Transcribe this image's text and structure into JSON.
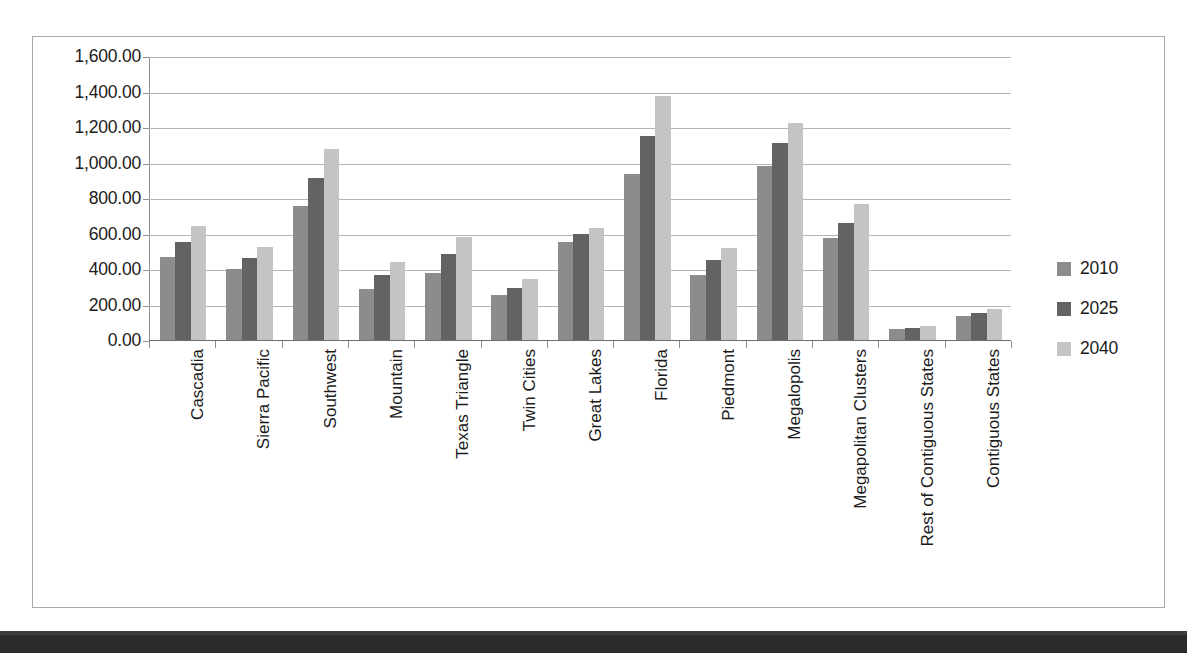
{
  "chart_data": {
    "type": "bar",
    "title": "",
    "xlabel": "",
    "ylabel": "",
    "grid": true,
    "legend_position": "right",
    "ylim": [
      0,
      1600
    ],
    "ytick_interval": 200,
    "ytick_labels": [
      "1,600.00",
      "1,400.00",
      "1,200.00",
      "1,000.00",
      "800.00",
      "600.00",
      "400.00",
      "200.00",
      "0.00"
    ],
    "ytick_values": [
      1600,
      1400,
      1200,
      1000,
      800,
      600,
      400,
      200,
      0
    ],
    "categories": [
      "Cascadia",
      "Sierra Pacific",
      "Southwest",
      "Mountain",
      "Texas Triangle",
      "Twin Cities",
      "Great Lakes",
      "Florida",
      "Piedmont",
      "Megalopolis",
      "Megapolitan Clusters",
      "Rest of Contiguous States",
      "Contiguous States"
    ],
    "series": [
      {
        "name": "2010",
        "color": "#8c8c8c",
        "values": [
          465,
          400,
          755,
          290,
          375,
          255,
          550,
          935,
          365,
          980,
          575,
          60,
          135
        ]
      },
      {
        "name": "2025",
        "color": "#636363",
        "values": [
          550,
          460,
          915,
          365,
          485,
          295,
          600,
          1150,
          450,
          1110,
          660,
          70,
          150
        ]
      },
      {
        "name": "2040",
        "color": "#c4c4c4",
        "values": [
          645,
          525,
          1075,
          440,
          580,
          345,
          630,
          1375,
          520,
          1220,
          765,
          78,
          172
        ]
      }
    ]
  },
  "legend": {
    "entries": [
      {
        "label": "2010",
        "color": "#8c8c8c"
      },
      {
        "label": "2025",
        "color": "#636363"
      },
      {
        "label": "2040",
        "color": "#c4c4c4"
      }
    ]
  },
  "colors": {
    "series_2010": "#8c8c8c",
    "series_2025": "#636363",
    "series_2040": "#c4c4c4",
    "gridline": "#b4b4b4",
    "axis": "#8f8f8f",
    "text": "#1b1b1b",
    "border": "#a9a9a9",
    "scan_band": "#2b2b2b"
  }
}
